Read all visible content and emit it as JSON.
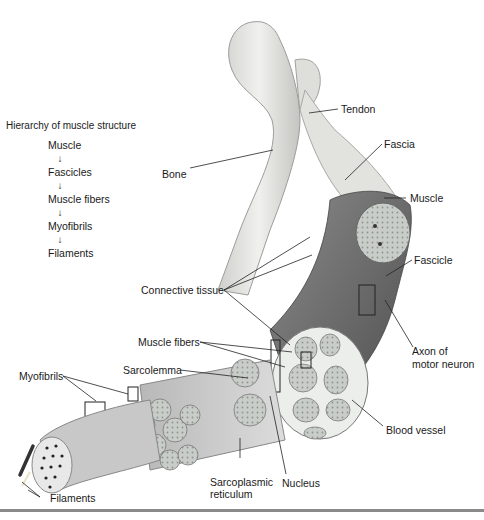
{
  "figure": {
    "type": "anatomical-diagram"
  },
  "hierarchy": {
    "title": "Hierarchy of muscle structure",
    "levels": [
      "Muscle",
      "Fascicles",
      "Muscle fibers",
      "Myofibrils",
      "Filaments"
    ],
    "arrow_glyph": "↓"
  },
  "labels": {
    "tendon": "Tendon",
    "fascia": "Fascia",
    "bone": "Bone",
    "muscle": "Muscle",
    "fascicle": "Fascicle",
    "connective_tissue": "Connective tissue",
    "axon_line1": "Axon of",
    "axon_line2": "motor neuron",
    "muscle_fibers": "Muscle fibers",
    "sarcolemma": "Sarcolemma",
    "myofibrils": "Myofibrils",
    "blood_vessel": "Blood vessel",
    "sarcoplasmic_line1": "Sarcoplasmic",
    "sarcoplasmic_line2": "reticulum",
    "nucleus": "Nucleus",
    "filaments": "Filaments"
  },
  "colors": {
    "bone": "#e6e6e3",
    "muscle_dark": "#6e6e6e",
    "muscle_mid": "#9a9a9a",
    "fascicle_fill": "#c9cdc9",
    "leader": "#222222",
    "rule": "#8a8a8a"
  }
}
